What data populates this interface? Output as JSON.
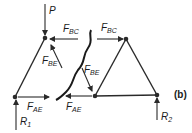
{
  "figure": {
    "panel_label": "(b)"
  },
  "nodes": {
    "left_top": {
      "x": 45,
      "y": 38
    },
    "left_bottom": {
      "x": 15,
      "y": 97
    },
    "right_top": {
      "x": 126,
      "y": 39
    },
    "right_bottom_mid": {
      "x": 95,
      "y": 96
    },
    "right_bottom": {
      "x": 157,
      "y": 95
    }
  },
  "labels": {
    "P": "P",
    "F_BC_left": {
      "main": "F",
      "sub": "BC"
    },
    "F_BE_left": {
      "main": "F",
      "sub": "BE"
    },
    "F_AE_left": {
      "main": "F",
      "sub": "AE"
    },
    "R1": {
      "main": "R",
      "sub": "1"
    },
    "F_BC_right": {
      "main": "F",
      "sub": "BC"
    },
    "F_BE_right": {
      "main": "F",
      "sub": "BE"
    },
    "F_AE_right": {
      "main": "F",
      "sub": "AE"
    },
    "R2": {
      "main": "R",
      "sub": "2"
    }
  },
  "colors": {
    "line": "#2a2a2a",
    "text": "#1a1a1a",
    "background": "#ffffff"
  }
}
